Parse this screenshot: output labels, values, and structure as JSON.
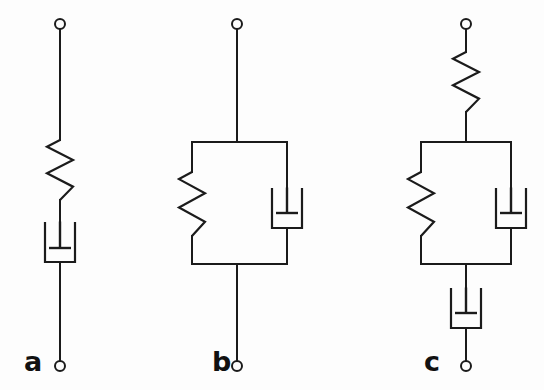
{
  "figure": {
    "background_color": "#fdfdfd",
    "line_color": "#1b1b1b",
    "width": 544,
    "height": 390
  },
  "panels": [
    {
      "id": "a",
      "label": "a",
      "label_x": 24,
      "label_y": 371,
      "model_name": "Maxwell model",
      "arrangement": "series",
      "center_x": 60,
      "terminal_top": {
        "cx": 60,
        "cy": 24,
        "r": 5
      },
      "terminal_bottom": {
        "cx": 60,
        "cy": 366,
        "r": 5
      },
      "elements": [
        {
          "type": "spring",
          "name": "spring-a",
          "x": 60,
          "y_top": 140,
          "y_bottom": 200,
          "amplitude": 13,
          "zigzags": 4
        },
        {
          "type": "dashpot",
          "name": "dashpot-a",
          "x": 60,
          "y_top": 222,
          "y_bottom": 262,
          "half_width": 15,
          "piston_half_width": 11,
          "piston_y": 248
        }
      ],
      "leads": [
        {
          "name": "lead-top-a",
          "x1": 60,
          "y1": 29,
          "x2": 60,
          "y2": 140
        },
        {
          "name": "lead-mid-a",
          "x1": 60,
          "y1": 200,
          "x2": 60,
          "y2": 222
        },
        {
          "name": "lead-bottom-a",
          "x1": 60,
          "y1": 262,
          "x2": 60,
          "y2": 361
        }
      ]
    },
    {
      "id": "b",
      "label": "b",
      "label_x": 212,
      "label_y": 371,
      "model_name": "Kelvin-Voigt model",
      "arrangement": "parallel",
      "center_x": 237,
      "terminal_top": {
        "cx": 237,
        "cy": 24,
        "r": 5
      },
      "terminal_bottom": {
        "cx": 237,
        "cy": 366,
        "r": 5
      },
      "parallel_box": {
        "left": 192,
        "right": 287,
        "top": 142,
        "bottom": 264
      },
      "elements": [
        {
          "type": "spring",
          "name": "spring-b",
          "x": 192,
          "y_top": 172,
          "y_bottom": 236,
          "amplitude": 13,
          "zigzags": 4
        },
        {
          "type": "dashpot",
          "name": "dashpot-b",
          "x": 287,
          "y_top": 188,
          "y_bottom": 228,
          "half_width": 15,
          "piston_half_width": 11,
          "piston_y": 213
        }
      ],
      "leads": [
        {
          "name": "lead-top-b",
          "x1": 237,
          "y1": 29,
          "x2": 237,
          "y2": 142
        },
        {
          "name": "lead-bottom-b",
          "x1": 237,
          "y1": 264,
          "x2": 237,
          "y2": 361
        }
      ]
    },
    {
      "id": "c",
      "label": "c",
      "label_x": 424,
      "label_y": 371,
      "model_name": "Burgers model",
      "arrangement": "series-parallel-series",
      "center_x": 466,
      "terminal_top": {
        "cx": 466,
        "cy": 24,
        "r": 5
      },
      "terminal_bottom": {
        "cx": 466,
        "cy": 366,
        "r": 5
      },
      "parallel_box": {
        "left": 421,
        "right": 511,
        "top": 142,
        "bottom": 264
      },
      "elements": [
        {
          "type": "spring",
          "name": "spring-c-series",
          "x": 466,
          "y_top": 52,
          "y_bottom": 112,
          "amplitude": 13,
          "zigzags": 4
        },
        {
          "type": "spring",
          "name": "spring-c-parallel",
          "x": 421,
          "y_top": 172,
          "y_bottom": 236,
          "amplitude": 13,
          "zigzags": 4
        },
        {
          "type": "dashpot",
          "name": "dashpot-c-parallel",
          "x": 511,
          "y_top": 188,
          "y_bottom": 228,
          "half_width": 15,
          "piston_half_width": 11,
          "piston_y": 213
        },
        {
          "type": "dashpot",
          "name": "dashpot-c-series",
          "x": 466,
          "y_top": 288,
          "y_bottom": 328,
          "half_width": 15,
          "piston_half_width": 11,
          "piston_y": 313
        }
      ],
      "leads": [
        {
          "name": "lead-top-c",
          "x1": 466,
          "y1": 29,
          "x2": 466,
          "y2": 52
        },
        {
          "name": "lead-upper-mid-c",
          "x1": 466,
          "y1": 112,
          "x2": 466,
          "y2": 142
        },
        {
          "name": "lead-lower-mid-c",
          "x1": 466,
          "y1": 264,
          "x2": 466,
          "y2": 288
        },
        {
          "name": "lead-bottom-c",
          "x1": 466,
          "y1": 328,
          "x2": 466,
          "y2": 361
        }
      ]
    }
  ]
}
